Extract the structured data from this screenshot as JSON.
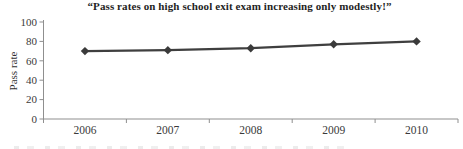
{
  "chart_data": {
    "type": "line",
    "title": "“Pass rates on high school exit exam increasing only modestly!”",
    "categories": [
      "2006",
      "2007",
      "2008",
      "2009",
      "2010"
    ],
    "series": [
      {
        "name": "Pass rate",
        "values": [
          70,
          71,
          73,
          77,
          80
        ]
      }
    ],
    "xlabel": "",
    "ylabel": "Pass rate",
    "ylim": [
      0,
      100
    ],
    "yticks": [
      0,
      20,
      40,
      60,
      80,
      100
    ],
    "grid": false,
    "legend": "none",
    "marker": "diamond",
    "colors": {
      "line": "#3f3f3f",
      "marker": "#3a3a3a",
      "axis": "#8f8f8f",
      "tick_text": "#3a3a3a",
      "title_text": "#1f1f1f"
    }
  }
}
